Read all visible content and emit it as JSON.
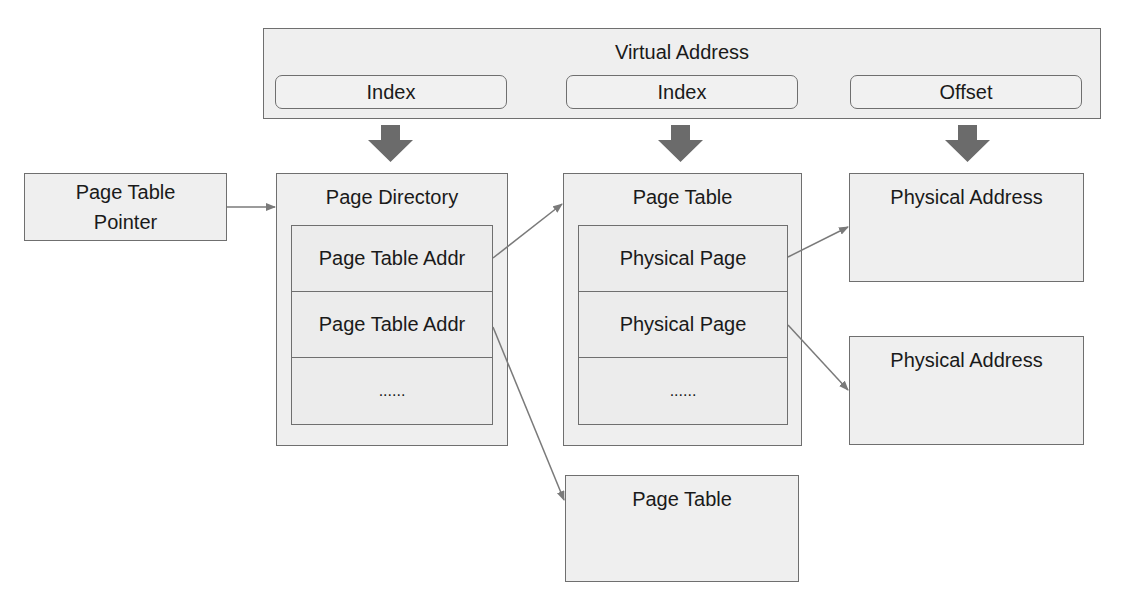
{
  "virtual_address": {
    "title": "Virtual Address",
    "fields": [
      {
        "label": "Index"
      },
      {
        "label": "Index"
      },
      {
        "label": "Offset"
      }
    ]
  },
  "page_table_pointer": {
    "label": "Page Table\nPointer",
    "line1": "Page Table",
    "line2": "Pointer"
  },
  "page_directory": {
    "title": "Page Directory",
    "entries": [
      "Page Table Addr",
      "Page Table Addr",
      "......"
    ]
  },
  "page_table_main": {
    "title": "Page Table",
    "entries": [
      "Physical Page",
      "Physical Page",
      "......"
    ]
  },
  "page_table_secondary": {
    "title": "Page Table"
  },
  "physical_addresses": [
    {
      "title": "Physical Address"
    },
    {
      "title": "Physical Address"
    }
  ],
  "colors": {
    "box_fill": "#efefef",
    "border": "#6f6f6f",
    "fat_arrow": "#6b6b6b",
    "connector": "#7a7a7a"
  }
}
